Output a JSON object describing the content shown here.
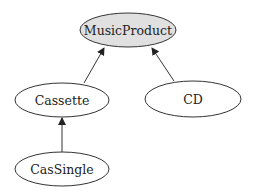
{
  "diagram": {
    "type": "class-hierarchy",
    "nodes": [
      {
        "id": "musicproduct",
        "label": "MusicProduct",
        "cx": 128,
        "cy": 30,
        "rx": 48,
        "ry": 17,
        "fill": "#e0e0e0"
      },
      {
        "id": "cassette",
        "label": "Cassette",
        "cx": 62,
        "cy": 100,
        "rx": 47,
        "ry": 17,
        "fill": "#ffffff"
      },
      {
        "id": "cd",
        "label": "CD",
        "cx": 193,
        "cy": 99,
        "rx": 48,
        "ry": 18,
        "fill": "#ffffff"
      },
      {
        "id": "cassingle",
        "label": "CasSingle",
        "cx": 62,
        "cy": 169,
        "rx": 47,
        "ry": 17,
        "fill": "#ffffff"
      }
    ],
    "edges": [
      {
        "from": "cassette",
        "to": "musicproduct"
      },
      {
        "from": "cd",
        "to": "musicproduct"
      },
      {
        "from": "cassingle",
        "to": "cassette"
      }
    ],
    "colors": {
      "stroke": "#333333",
      "root_fill": "#e0e0e0"
    }
  }
}
